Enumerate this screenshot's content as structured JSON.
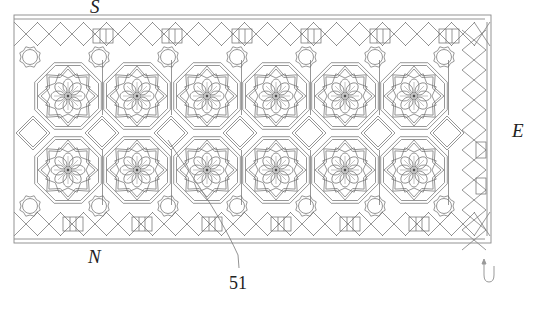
{
  "figure": {
    "labels": {
      "south": "S",
      "east": "E",
      "north": "N",
      "reference_numeral": "51"
    },
    "pattern": {
      "rosette_columns": 6,
      "rosette_rows": 2,
      "rosette_petals": 8,
      "diamond_count": 7,
      "border_circle_medallions_top": 7,
      "border_circle_medallions_bottom": 7
    },
    "colors": {
      "line": "#6a6a6a",
      "frame": "#888888",
      "label": "#222222",
      "background": "#ffffff"
    },
    "icons": [
      "return-arrow-icon"
    ]
  }
}
